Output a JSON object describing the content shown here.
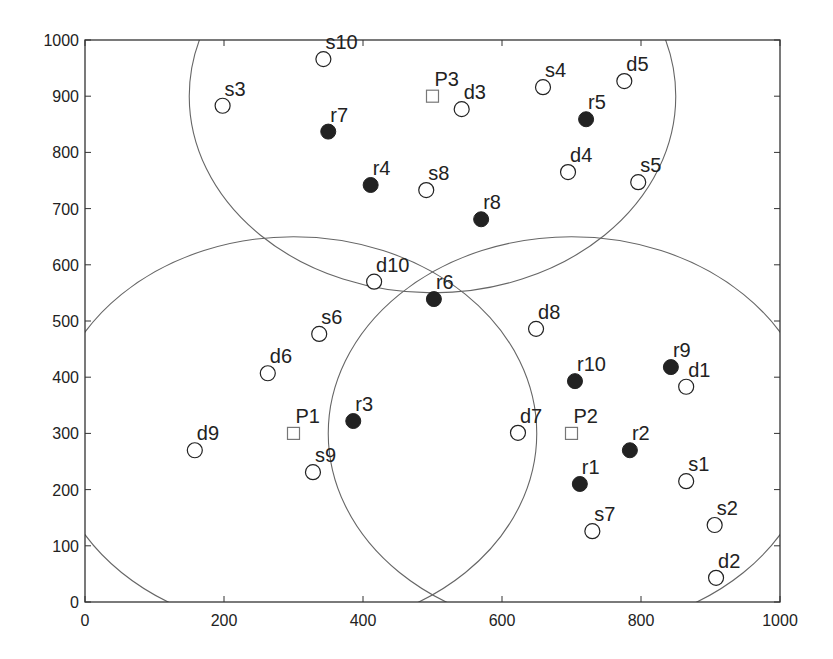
{
  "chart_data": {
    "type": "scatter",
    "title": "",
    "xlabel": "",
    "ylabel": "",
    "xlim": [
      0,
      1000
    ],
    "ylim": [
      0,
      1000
    ],
    "grid": false,
    "legend": null,
    "x_ticks": [
      0,
      200,
      400,
      600,
      800,
      1000
    ],
    "y_ticks": [
      0,
      100,
      200,
      300,
      400,
      500,
      600,
      700,
      800,
      900,
      1000
    ],
    "series": [
      {
        "name": "sources",
        "marker": "open-circle",
        "points": [
          {
            "label": "s1",
            "x": 865,
            "y": 215
          },
          {
            "label": "s2",
            "x": 906,
            "y": 137
          },
          {
            "label": "s3",
            "x": 198,
            "y": 883
          },
          {
            "label": "s4",
            "x": 659,
            "y": 916
          },
          {
            "label": "s5",
            "x": 796,
            "y": 747
          },
          {
            "label": "s6",
            "x": 337,
            "y": 477
          },
          {
            "label": "s7",
            "x": 730,
            "y": 126
          },
          {
            "label": "s8",
            "x": 491,
            "y": 733
          },
          {
            "label": "s9",
            "x": 328,
            "y": 231
          },
          {
            "label": "s10",
            "x": 343,
            "y": 966
          }
        ]
      },
      {
        "name": "destinations",
        "marker": "open-circle",
        "points": [
          {
            "label": "d1",
            "x": 865,
            "y": 383
          },
          {
            "label": "d2",
            "x": 908,
            "y": 43
          },
          {
            "label": "d3",
            "x": 542,
            "y": 877
          },
          {
            "label": "d4",
            "x": 695,
            "y": 765
          },
          {
            "label": "d5",
            "x": 776,
            "y": 927
          },
          {
            "label": "d6",
            "x": 263,
            "y": 407
          },
          {
            "label": "d7",
            "x": 623,
            "y": 301
          },
          {
            "label": "d8",
            "x": 649,
            "y": 486
          },
          {
            "label": "d9",
            "x": 158,
            "y": 270
          },
          {
            "label": "d10",
            "x": 416,
            "y": 570
          }
        ]
      },
      {
        "name": "relays",
        "marker": "filled-circle",
        "points": [
          {
            "label": "r1",
            "x": 712,
            "y": 210
          },
          {
            "label": "r2",
            "x": 784,
            "y": 270
          },
          {
            "label": "r3",
            "x": 386,
            "y": 322
          },
          {
            "label": "r4",
            "x": 411,
            "y": 742
          },
          {
            "label": "r5",
            "x": 721,
            "y": 859
          },
          {
            "label": "r6",
            "x": 502,
            "y": 539
          },
          {
            "label": "r7",
            "x": 350,
            "y": 837
          },
          {
            "label": "r8",
            "x": 570,
            "y": 681
          },
          {
            "label": "r9",
            "x": 843,
            "y": 418
          },
          {
            "label": "r10",
            "x": 705,
            "y": 393
          }
        ]
      },
      {
        "name": "access points",
        "marker": "open-square",
        "points": [
          {
            "label": "P1",
            "x": 300,
            "y": 300
          },
          {
            "label": "P2",
            "x": 700,
            "y": 300
          },
          {
            "label": "P3",
            "x": 500,
            "y": 900
          }
        ]
      }
    ],
    "coverage_circles": [
      {
        "center": "P1",
        "cx": 300,
        "cy": 300,
        "r": 350
      },
      {
        "center": "P2",
        "cx": 700,
        "cy": 300,
        "r": 350
      },
      {
        "center": "P3",
        "cx": 500,
        "cy": 900,
        "r": 350
      }
    ],
    "colors": {
      "axis": "#333333",
      "circle": "#666666",
      "marker": "#222222",
      "square": "#777777"
    }
  }
}
